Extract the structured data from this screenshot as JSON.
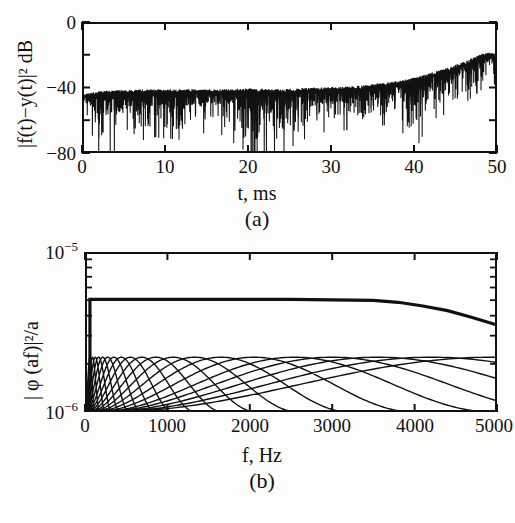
{
  "figure": {
    "background": "#fdfdfb",
    "ink": "#111111"
  },
  "panel_a": {
    "caption": "(a)",
    "xlabel": "t,  ms",
    "ylabel_html": "|f(t)−y(t)|² dB",
    "ylabel_plain": "|f(t)-y(t)|^2 dB",
    "xticks": [
      "0",
      "10",
      "20",
      "30",
      "40",
      "50"
    ],
    "yticks": [
      "0",
      "−40",
      "−80"
    ],
    "chart_data": {
      "type": "line",
      "title": "(a)",
      "xlabel": "t,  ms",
      "ylabel": "|f(t)-y(t)|^2 dB",
      "xlim": [
        0,
        50
      ],
      "ylim": [
        -80,
        0
      ],
      "xticks": [
        0,
        10,
        20,
        30,
        40,
        50
      ],
      "yticks": [
        0,
        -20,
        -40,
        -60,
        -80
      ],
      "minor_yticks": [
        -20,
        -60
      ],
      "grid": false,
      "legend": null,
      "description": "Dense oscillatory reconstruction-error trace; noise floor band roughly -40 to -55 dB for t<35 ms with deep downward spikes reaching -80 dB, then a rising oscillatory envelope climbing to about -18 dB near t=48-49 ms before falling off at t=50 ms.",
      "series": [
        {
          "name": "error_envelope_upper",
          "comment": "upper envelope of |f(t)-y(t)|^2 in dB",
          "x": [
            0,
            2,
            5,
            8,
            12,
            16,
            20,
            24,
            28,
            32,
            35,
            38,
            40,
            42,
            44,
            46,
            47,
            48,
            49,
            49.6,
            50
          ],
          "values": [
            -44,
            -42,
            -41.5,
            -41,
            -41,
            -41,
            -40.5,
            -41,
            -40,
            -39.5,
            -38,
            -36,
            -34,
            -31,
            -28,
            -24,
            -22,
            -19.5,
            -18.5,
            -19,
            -22
          ]
        },
        {
          "name": "error_envelope_lower",
          "comment": "lower envelope / spike floor in dB",
          "x": [
            0,
            2,
            5,
            8,
            12,
            16,
            20,
            24,
            28,
            32,
            35,
            38,
            40,
            42,
            44,
            46,
            47,
            48,
            49,
            49.6,
            50
          ],
          "values": [
            -52,
            -80,
            -80,
            -70,
            -72,
            -66,
            -80,
            -80,
            -68,
            -66,
            -64,
            -62,
            -80,
            -60,
            -56,
            -50,
            -46,
            -42,
            -38,
            -40,
            -80
          ]
        }
      ]
    }
  },
  "panel_b": {
    "caption": "(b)",
    "xlabel": "f, Hz",
    "ylabel_html": "| φ (af)|²/a",
    "ylabel_plain": "| phi (af)|^2/a",
    "xticks": [
      "0",
      "1000",
      "2000",
      "3000",
      "4000",
      "5000"
    ],
    "yticks_html": [
      "10<sup>−5</sup>",
      "10<sup>−6</sup>"
    ],
    "yticks_plain": [
      "1e-5",
      "1e-6"
    ],
    "chart_data": {
      "type": "line",
      "title": "(b)",
      "xlabel": "f, Hz",
      "ylabel": "| phi (af)|^2/a",
      "xlim": [
        0,
        5000
      ],
      "ylim": [
        1e-06,
        1e-05
      ],
      "yscale": "log",
      "xticks": [
        0,
        1000,
        2000,
        3000,
        4000,
        5000
      ],
      "yticks": [
        1e-06,
        1e-05
      ],
      "grid": false,
      "legend": null,
      "description": "Wavelet filterbank magnitude responses on a log ordinate. A heavy flat summation curve sits at about 5.0e-6, essentially constant to 3500 Hz then rolling off to about 3.5e-6 at 5000 Hz. Beneath it a family of overlapping band-pass lobes all peak near 2.2e-6; lobe width grows geometrically with centre frequency so lobes crowd into a solid black mass below about 300 Hz and become very broad near 5000 Hz.",
      "series": [
        {
          "name": "sum_envelope",
          "comment": "heavy flat curve, total response",
          "x": [
            0,
            60,
            500,
            1000,
            1500,
            2000,
            2500,
            3000,
            3500,
            3800,
            4100,
            4400,
            4700,
            5000
          ],
          "values": [
            1e-06,
            5.05e-06,
            5.05e-06,
            5.05e-06,
            5.05e-06,
            5.05e-06,
            5.05e-06,
            5.02e-06,
            4.98e-06,
            4.85e-06,
            4.6e-06,
            4.3e-06,
            3.9e-06,
            3.5e-06
          ]
        },
        {
          "name": "filter_peak_level",
          "comment": "common peak value of every band-pass lobe",
          "values": [
            2.2e-06
          ]
        },
        {
          "name": "filter_centre_frequencies",
          "comment": "approximate lobe centres, geometrically spaced",
          "values": [
            60,
            90,
            125,
            165,
            215,
            275,
            350,
            440,
            550,
            690,
            860,
            1070,
            1330,
            1650,
            2050,
            2540,
            3000,
            3550,
            4200,
            4950
          ]
        }
      ]
    }
  }
}
